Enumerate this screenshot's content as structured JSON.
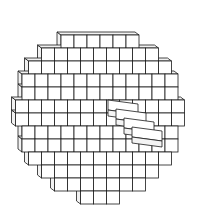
{
  "figure": {
    "style": "line drawing",
    "line_color": "#1a1a1a",
    "face_color": "#ffffff",
    "side_face_color": "#f2f2f2",
    "background": "#ffffff"
  }
}
